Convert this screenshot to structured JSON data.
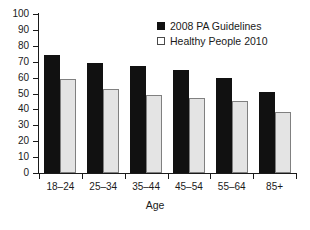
{
  "chart_data": {
    "type": "bar",
    "title": "",
    "subtitle": "",
    "xlabel": "Age",
    "ylabel": "",
    "ylim": [
      0,
      100
    ],
    "yticks": [
      0,
      10,
      20,
      30,
      40,
      50,
      60,
      70,
      80,
      90,
      100
    ],
    "grid": false,
    "legend_position": "top-right",
    "categories": [
      "18–24",
      "25–34",
      "35–44",
      "45–54",
      "55–64",
      "85+"
    ],
    "series": [
      {
        "name": "2008 PA Guidelines",
        "color": "#111111",
        "swatch": "filled-square",
        "values": [
          74,
          69.5,
          67,
          65,
          59.5,
          51
        ]
      },
      {
        "name": "Healthy People 2010",
        "color": "#e4e4e4",
        "swatch": "outlined-square",
        "values": [
          59,
          53,
          49,
          47,
          45,
          38.5
        ]
      }
    ]
  },
  "axis": {
    "x_title": "Age",
    "y_tick_labels": [
      "0",
      "10",
      "20",
      "30",
      "40",
      "50",
      "60",
      "70",
      "80",
      "90",
      "100"
    ]
  },
  "legend": {
    "items": [
      {
        "label": "2008 PA Guidelines"
      },
      {
        "label": "Healthy People 2010"
      }
    ]
  }
}
